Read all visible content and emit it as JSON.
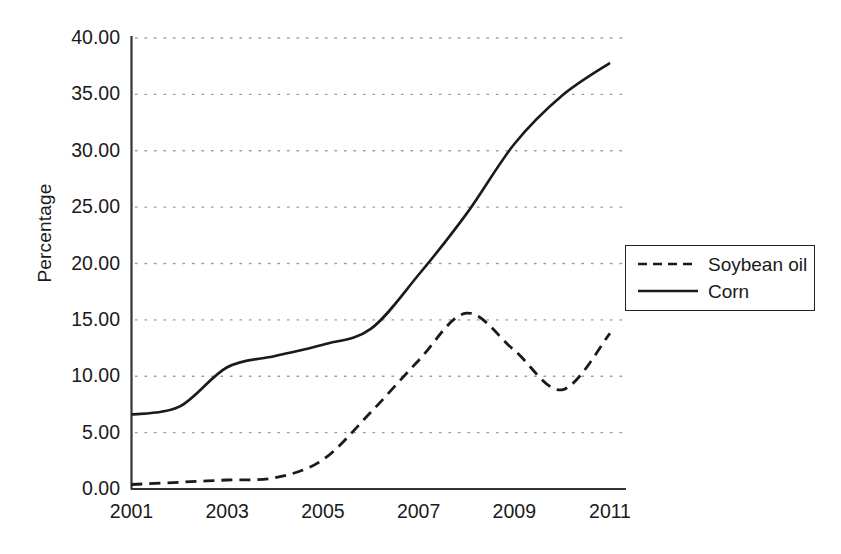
{
  "chart_data": {
    "type": "line",
    "title": "",
    "xlabel": "",
    "ylabel": "Percentage",
    "xlim": [
      2001,
      2011
    ],
    "ylim": [
      0,
      40
    ],
    "grid": true,
    "grid_style": "dotted-horizontal",
    "legend_position": "right-middle",
    "x": [
      2001,
      2002,
      2003,
      2004,
      2005,
      2006,
      2007,
      2008,
      2009,
      2010,
      2011
    ],
    "y_ticks": [
      "0.00",
      "5.00",
      "10.00",
      "15.00",
      "20.00",
      "25.00",
      "30.00",
      "35.00",
      "40.00"
    ],
    "y_tick_values": [
      0,
      5,
      10,
      15,
      20,
      25,
      30,
      35,
      40
    ],
    "x_ticks": [
      "2001",
      "2003",
      "2005",
      "2007",
      "2009",
      "2011"
    ],
    "x_tick_values": [
      2001,
      2003,
      2005,
      2007,
      2009,
      2011
    ],
    "series": [
      {
        "name": "Soybean oil",
        "style": "dashed",
        "color": "#1a1a1a",
        "values": [
          0.4,
          0.6,
          0.8,
          1.0,
          2.6,
          6.8,
          11.4,
          15.6,
          12.3,
          8.8,
          13.8
        ]
      },
      {
        "name": "Corn",
        "style": "solid",
        "color": "#1a1a1a",
        "values": [
          6.6,
          7.3,
          10.8,
          11.8,
          12.8,
          14.2,
          19.0,
          24.4,
          30.6,
          34.9,
          37.8
        ]
      }
    ]
  },
  "legend": {
    "items": [
      {
        "label": "Soybean oil",
        "style": "dashed"
      },
      {
        "label": "Corn",
        "style": "solid"
      }
    ]
  },
  "axes": {
    "y_title": "Percentage"
  }
}
